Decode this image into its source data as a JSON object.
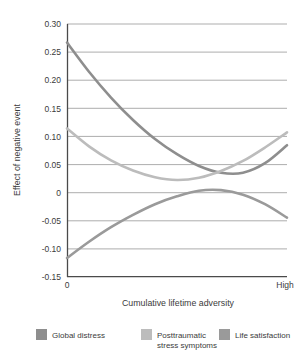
{
  "chart_data": {
    "type": "line",
    "title": "",
    "xlabel": "Cumulative lifetime adversity",
    "ylabel": "Effect of negative event",
    "xlim": [
      0,
      1
    ],
    "ylim": [
      -0.15,
      0.3
    ],
    "grid": true,
    "legend_position": "bottom",
    "x_tick_labels": [
      "0",
      "High"
    ],
    "y_tick_labels": [
      "0.30",
      "0.25",
      "0.20",
      "0.15",
      "0.10",
      "0.05",
      "0",
      "-0.05",
      "-0.10",
      "-0.15"
    ],
    "y_tick_values": [
      0.3,
      0.25,
      0.2,
      0.15,
      0.1,
      0.05,
      0,
      -0.05,
      -0.1,
      -0.15
    ],
    "x": [
      0,
      0.1,
      0.2,
      0.3,
      0.4,
      0.5,
      0.6,
      0.7,
      0.8,
      0.9,
      1.0
    ],
    "series": [
      {
        "name": "Global distress",
        "color": "#8e8e8e",
        "values": [
          0.267,
          0.215,
          0.169,
          0.129,
          0.095,
          0.068,
          0.047,
          0.035,
          0.035,
          0.052,
          0.084
        ]
      },
      {
        "name": "Posttraumatic stress symptoms",
        "color": "#bcbcbc",
        "values": [
          0.114,
          0.082,
          0.057,
          0.039,
          0.027,
          0.022,
          0.026,
          0.038,
          0.056,
          0.08,
          0.107
        ]
      },
      {
        "name": "Life satisfaction",
        "color": "#9a9a9a",
        "values": [
          -0.117,
          -0.088,
          -0.062,
          -0.04,
          -0.021,
          -0.007,
          0.003,
          0.004,
          -0.004,
          -0.021,
          -0.045
        ]
      }
    ]
  },
  "legend": {
    "items": [
      {
        "label_line1": "Global distress",
        "label_line2": "",
        "color": "#8e8e8e"
      },
      {
        "label_line1": "Posttraumatic",
        "label_line2": "stress symptoms",
        "color": "#bcbcbc"
      },
      {
        "label_line1": "Life satisfaction",
        "label_line2": "",
        "color": "#9a9a9a"
      }
    ]
  },
  "axes": {
    "y_title": "Effect of negative event",
    "x_title": "Cumulative lifetime adversity",
    "x_start_label": "0",
    "x_end_label": "High",
    "y_labels": [
      "0.30",
      "0.25",
      "0.20",
      "0.15",
      "0.10",
      "0.05",
      "0",
      "-0.05",
      "-0.10",
      "-0.15"
    ]
  }
}
